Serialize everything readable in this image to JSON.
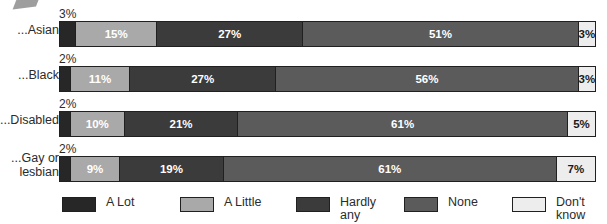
{
  "chart_data": {
    "type": "bar",
    "subtype": "stacked-horizontal-100",
    "title": "",
    "subtitle": "",
    "xlabel": "",
    "ylabel": "",
    "xlim": [
      0,
      100
    ],
    "grid": false,
    "legend_position": "bottom",
    "units": "%",
    "categories": [
      "...Asian",
      "...Black",
      "...Disabled",
      "...Gay or\nlesbian"
    ],
    "series": [
      {
        "name": "A Lot",
        "color": "#272727",
        "values": [
          3,
          2,
          2,
          2
        ]
      },
      {
        "name": "A Little",
        "color": "#a9a9a9",
        "values": [
          15,
          11,
          10,
          9
        ]
      },
      {
        "name": "Hardly any",
        "color": "#3b3b3b",
        "values": [
          27,
          27,
          21,
          19
        ]
      },
      {
        "name": "None",
        "color": "#5b5b5b",
        "values": [
          51,
          56,
          61,
          61
        ]
      },
      {
        "name": "Don't know",
        "color": "#ededed",
        "values": [
          3,
          3,
          5,
          7
        ]
      }
    ],
    "rows": [
      {
        "category": "...Asian",
        "outside_label": "3%",
        "segments": [
          {
            "series": "A Lot",
            "value": 3,
            "label": "",
            "tone": "s-alot"
          },
          {
            "series": "A Little",
            "value": 15,
            "label": "15%",
            "tone": "s-alittle"
          },
          {
            "series": "Hardly any",
            "value": 27,
            "label": "27%",
            "tone": "s-hardly"
          },
          {
            "series": "None",
            "value": 51,
            "label": "51%",
            "tone": "s-none"
          },
          {
            "series": "Don't know",
            "value": 3,
            "label": "3%",
            "tone": "s-dk"
          }
        ]
      },
      {
        "category": "...Black",
        "outside_label": "2%",
        "segments": [
          {
            "series": "A Lot",
            "value": 2,
            "label": "",
            "tone": "s-alot"
          },
          {
            "series": "A Little",
            "value": 11,
            "label": "11%",
            "tone": "s-alittle"
          },
          {
            "series": "Hardly any",
            "value": 27,
            "label": "27%",
            "tone": "s-hardly"
          },
          {
            "series": "None",
            "value": 56,
            "label": "56%",
            "tone": "s-none"
          },
          {
            "series": "Don't know",
            "value": 3,
            "label": "3%",
            "tone": "s-dk"
          }
        ]
      },
      {
        "category": "...Disabled",
        "outside_label": "2%",
        "segments": [
          {
            "series": "A Lot",
            "value": 2,
            "label": "",
            "tone": "s-alot"
          },
          {
            "series": "A Little",
            "value": 10,
            "label": "10%",
            "tone": "s-alittle"
          },
          {
            "series": "Hardly any",
            "value": 21,
            "label": "21%",
            "tone": "s-hardly"
          },
          {
            "series": "None",
            "value": 61,
            "label": "61%",
            "tone": "s-none"
          },
          {
            "series": "Don't know",
            "value": 5,
            "label": "5%",
            "tone": "s-dk"
          }
        ]
      },
      {
        "category": "...Gay or\nlesbian",
        "outside_label": "2%",
        "segments": [
          {
            "series": "A Lot",
            "value": 2,
            "label": "",
            "tone": "s-alot"
          },
          {
            "series": "A Little",
            "value": 9,
            "label": "9%",
            "tone": "s-alittle"
          },
          {
            "series": "Hardly any",
            "value": 19,
            "label": "19%",
            "tone": "s-hardly"
          },
          {
            "series": "None",
            "value": 61,
            "label": "61%",
            "tone": "s-none"
          },
          {
            "series": "Don't know",
            "value": 7,
            "label": "7%",
            "tone": "s-dk"
          }
        ]
      }
    ],
    "legend": [
      {
        "label": "A Lot",
        "color": "#272727",
        "tone": "s-alot"
      },
      {
        "label": "A Little",
        "color": "#a9a9a9",
        "tone": "s-alittle"
      },
      {
        "label": "Hardly\nany",
        "color": "#3b3b3b",
        "tone": "s-hardly"
      },
      {
        "label": "None",
        "color": "#5b5b5b",
        "tone": "s-none"
      },
      {
        "label": "Don't\nknow",
        "color": "#ededed",
        "tone": "s-dk"
      }
    ]
  }
}
